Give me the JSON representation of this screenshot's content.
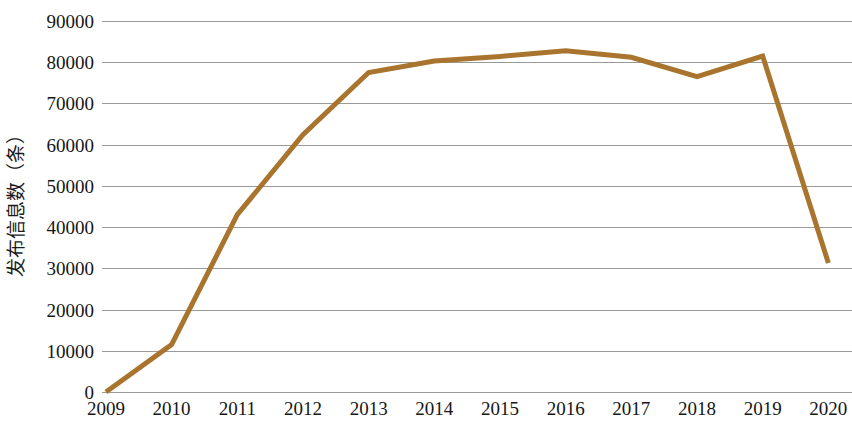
{
  "chart_data": {
    "type": "line",
    "title": "",
    "subtitle": "",
    "xlabel": "",
    "ylabel": "发布信息数（条）",
    "x": [
      "2009",
      "2010",
      "2011",
      "2012",
      "2013",
      "2014",
      "2015",
      "2016",
      "2017",
      "2018",
      "2019",
      "2020"
    ],
    "categories": [
      "2009",
      "2010",
      "2011",
      "2012",
      "2013",
      "2014",
      "2015",
      "2016",
      "2017",
      "2018",
      "2019",
      "2020"
    ],
    "values": [
      0,
      11500,
      43000,
      62400,
      77500,
      80300,
      81400,
      82800,
      81200,
      76500,
      81500,
      31300
    ],
    "series": [
      {
        "name": "发布信息数（条）",
        "values": [
          0,
          11500,
          43000,
          62400,
          77500,
          80300,
          81400,
          82800,
          81200,
          76500,
          81500,
          31300
        ]
      }
    ],
    "ylim": [
      0,
      90000
    ],
    "yticks": [
      0,
      10000,
      20000,
      30000,
      40000,
      50000,
      60000,
      70000,
      80000,
      90000
    ],
    "ytick_labels": [
      "0",
      "10000",
      "20000",
      "30000",
      "40000",
      "50000",
      "60000",
      "70000",
      "80000",
      "90000"
    ],
    "grid": "horizontal",
    "legend": "none",
    "line_color": "#a9752e",
    "line_width": 5,
    "gridline_color": "#9a9a9a",
    "background": "#ffffff",
    "annotations": []
  }
}
